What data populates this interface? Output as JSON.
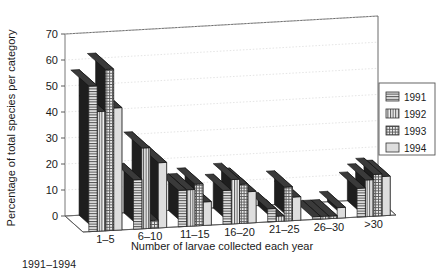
{
  "caption": "1991–1994",
  "chart_data": {
    "type": "bar",
    "title": "",
    "xlabel": "Number of larvae collected each year",
    "ylabel": "Percentage of total species per category",
    "categories": [
      "1–5",
      "6–10",
      "11–15",
      "16–20",
      "21–25",
      "26–30",
      ">30"
    ],
    "series": [
      {
        "name": "1991",
        "pattern": "horizontal-lines",
        "values": [
          56,
          19,
          14,
          13,
          5,
          1,
          11
        ]
      },
      {
        "name": "1992",
        "pattern": "vertical-lines",
        "values": [
          46,
          31,
          14,
          17,
          2,
          1,
          14
        ]
      },
      {
        "name": "1993",
        "pattern": "crosshatch",
        "values": [
          62,
          3,
          16,
          15,
          13,
          1,
          16
        ]
      },
      {
        "name": "1994",
        "pattern": "plain-light",
        "values": [
          47,
          25,
          9,
          12,
          9,
          4,
          15
        ]
      }
    ],
    "ylim": [
      0,
      70
    ],
    "yticks": [
      0,
      10,
      20,
      30,
      40,
      50,
      60,
      70
    ],
    "ytick_labels": [
      "0",
      "10",
      "20",
      "30",
      "40",
      "50",
      "60",
      "70"
    ],
    "grid": true,
    "legend_position": "right",
    "projection": "3d-bar"
  },
  "legend": {
    "entries": [
      "1991",
      "1992",
      "1993",
      "1994"
    ]
  },
  "colors": {
    "bar_face": "#e3e3e3",
    "bar_top": "#3a3a3a",
    "bar_side": "#1e1e1e",
    "axis": "#4a4a4a",
    "grid": "#d8d8d8",
    "text": "#1a1a1a"
  }
}
